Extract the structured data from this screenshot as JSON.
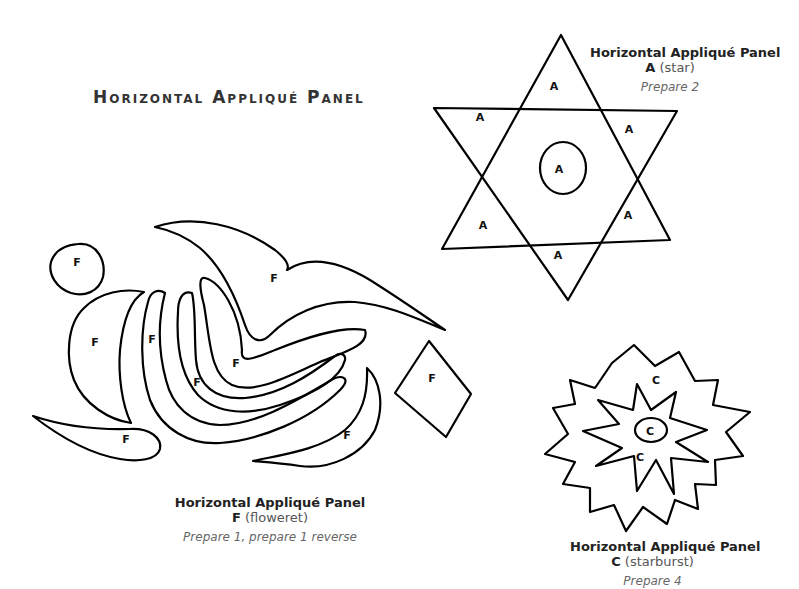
{
  "page": {
    "title": "Horizontal Appliqué Panel"
  },
  "captions": {
    "star": {
      "heading": "Horizontal Appliqué Panel",
      "piece_letter": "A",
      "piece_desc": "(star)",
      "prepare": "Prepare 2"
    },
    "floweret": {
      "heading": "Horizontal Appliqué Panel",
      "piece_letter": "F",
      "piece_desc": "(floweret)",
      "prepare": "Prepare 1, prepare 1 reverse"
    },
    "starburst": {
      "heading": "Horizontal Appliqué Panel",
      "piece_letter": "C",
      "piece_desc": "(starburst)",
      "prepare": "Prepare 4"
    }
  },
  "templates": {
    "star": {
      "piece_label": "A",
      "label_count": 7
    },
    "floweret": {
      "piece_label": "F",
      "label_count": 11
    },
    "starburst": {
      "piece_label": "C",
      "label_count": 3
    }
  },
  "colors": {
    "line": "#000000",
    "background": "#ffffff",
    "caption_italic": "#666666"
  }
}
